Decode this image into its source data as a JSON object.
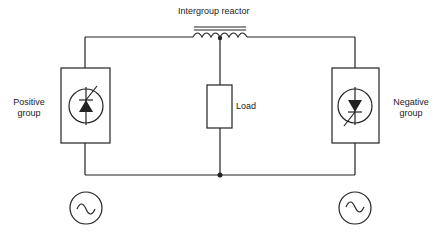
{
  "diagram": {
    "title_label": "Intergroup  reactor",
    "positive_group": {
      "line1": "Positive",
      "line2": "group"
    },
    "negative_group": {
      "line1": "Negative",
      "line2": "group"
    },
    "load_label": "Load",
    "components": [
      {
        "name": "intergroup-reactor",
        "type": "center-tapped-inductor"
      },
      {
        "name": "positive-group-converter",
        "type": "thyristor",
        "orientation": "up"
      },
      {
        "name": "negative-group-converter",
        "type": "thyristor",
        "orientation": "down"
      },
      {
        "name": "load",
        "type": "resistor"
      },
      {
        "name": "ac-source-left",
        "type": "ac-source"
      },
      {
        "name": "ac-source-right",
        "type": "ac-source"
      }
    ],
    "colors": {
      "line": "#222222",
      "background": "#ffffff"
    }
  }
}
